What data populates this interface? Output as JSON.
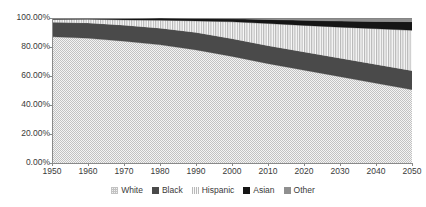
{
  "chart_data": {
    "type": "area",
    "stacked": true,
    "percent": true,
    "title": "",
    "xlabel": "",
    "ylabel": "",
    "grid": false,
    "legend_position": "bottom",
    "xlim": [
      1950,
      2050
    ],
    "ylim": [
      0,
      100
    ],
    "x": [
      1950,
      1960,
      1970,
      1980,
      1990,
      2000,
      2010,
      2020,
      2030,
      2040,
      2050
    ],
    "xtick_labels": [
      "1950",
      "1960",
      "1970",
      "1980",
      "1990",
      "2000",
      "2010",
      "2020",
      "2030",
      "2040",
      "2050"
    ],
    "ytick_labels": [
      "0.00%",
      "20.00%",
      "40.00%",
      "60.00%",
      "80.00%",
      "100.00%"
    ],
    "ytick_values": [
      0,
      20,
      40,
      60,
      80,
      100
    ],
    "series": [
      {
        "name": "White",
        "color": "#c2c2c2",
        "pattern": "checker",
        "values": [
          87.0,
          86.0,
          84.0,
          81.5,
          78.0,
          73.5,
          68.5,
          64.0,
          59.5,
          55.0,
          50.5
        ]
      },
      {
        "name": "Black",
        "color": "#4a4a4a",
        "pattern": "solid",
        "values": [
          10.0,
          10.5,
          11.0,
          11.5,
          12.0,
          12.2,
          12.4,
          12.6,
          12.8,
          13.0,
          13.2
        ]
      },
      {
        "name": "Hispanic",
        "color": "#ededed",
        "pattern": "vertical-stripes",
        "values": [
          2.0,
          2.6,
          3.7,
          5.5,
          8.0,
          11.7,
          15.3,
          18.3,
          21.4,
          24.6,
          27.8
        ]
      },
      {
        "name": "Asian",
        "color": "#151515",
        "pattern": "solid",
        "values": [
          0.4,
          0.5,
          0.8,
          1.5,
          1.7,
          2.1,
          2.8,
          3.5,
          4.2,
          5.0,
          6.0
        ]
      },
      {
        "name": "Other",
        "color": "#8f8f8f",
        "pattern": "solid",
        "values": [
          0.6,
          0.4,
          0.5,
          0.0,
          0.3,
          0.5,
          1.0,
          1.6,
          2.1,
          2.4,
          2.5
        ]
      }
    ]
  },
  "legend": {
    "items": [
      {
        "label": "White",
        "swatch": "sw-white"
      },
      {
        "label": "Black",
        "swatch": "sw-black"
      },
      {
        "label": "Hispanic",
        "swatch": "sw-hispanic"
      },
      {
        "label": "Asian",
        "swatch": "sw-asian"
      },
      {
        "label": "Other",
        "swatch": "sw-other"
      }
    ]
  }
}
